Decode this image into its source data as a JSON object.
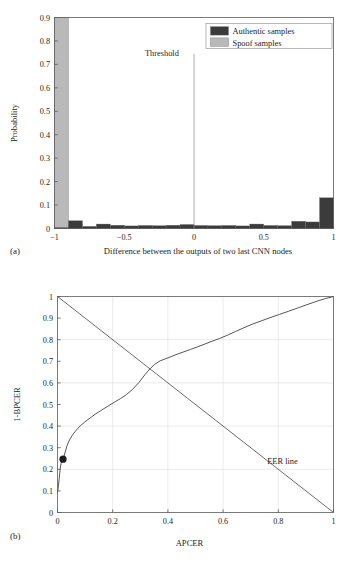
{
  "figure": {
    "background": "#ffffff",
    "panels": [
      {
        "label": "(a)"
      },
      {
        "label": "(b)"
      }
    ]
  },
  "colors": {
    "authentic": "#3b3b3b",
    "spoof": "#b9b9b9",
    "axis": "#5a5a5a",
    "grid": "#e2e2e2",
    "curve": "#565656",
    "eer": "#4f4f4f",
    "marker": "#1c1c1c",
    "legend_border": "#9a9a9a"
  },
  "chart_data": [
    {
      "type": "bar",
      "panel": "(a)",
      "title": "",
      "xlabel": "Difference between the outputs of two last CNN nodes",
      "ylabel": "Probability",
      "xlim": [
        -1,
        1
      ],
      "ylim": [
        0,
        0.9
      ],
      "xticks": [
        -1,
        -0.5,
        0,
        0.5,
        1
      ],
      "xtick_labels": [
        "−1",
        "−0.5",
        "0",
        "0.5",
        "1"
      ],
      "yticks": [
        0,
        0.1,
        0.2,
        0.3,
        0.4,
        0.5,
        0.6,
        0.7,
        0.8,
        0.9
      ],
      "ytick_labels": [
        "0",
        "0.1",
        "0.2",
        "0.3",
        "0.4",
        "0.5",
        "0.6",
        "0.7",
        "0.8",
        "0.9"
      ],
      "grid": false,
      "legend_position": "top-right",
      "bin_edges": [
        -1.0,
        -0.9,
        -0.8,
        -0.7,
        -0.6,
        -0.5,
        -0.4,
        -0.3,
        -0.2,
        -0.1,
        0.0,
        0.1,
        0.2,
        0.3,
        0.4,
        0.5,
        0.6,
        0.7,
        0.8,
        0.9,
        1.0
      ],
      "series": [
        {
          "name": "Spoof samples",
          "color": "#b9b9b9",
          "values": [
            0.9,
            0.018,
            0.006,
            0.004,
            0.004,
            0.004,
            0.003,
            0.003,
            0.003,
            0.003,
            0.003,
            0.002,
            0.002,
            0.002,
            0.002,
            0.002,
            0.002,
            0.002,
            0.002,
            0.002
          ]
        },
        {
          "name": "Authentic samples",
          "color": "#3b3b3b",
          "values": [
            0.004,
            0.033,
            0.009,
            0.019,
            0.014,
            0.011,
            0.013,
            0.012,
            0.014,
            0.017,
            0.013,
            0.012,
            0.013,
            0.011,
            0.019,
            0.013,
            0.012,
            0.031,
            0.028,
            0.131
          ]
        }
      ],
      "annotations": [
        {
          "text": "Threshold",
          "x": -0.23,
          "y": 0.735,
          "line_x": 0.0,
          "line_y_top": 0.745,
          "line_y_bottom": 0.0
        }
      ]
    },
    {
      "type": "line",
      "panel": "(b)",
      "title": "",
      "xlabel": "APCER",
      "ylabel": "1-BPCER",
      "xlim": [
        0,
        1
      ],
      "ylim": [
        0,
        1
      ],
      "xticks": [
        0,
        0.2,
        0.4,
        0.6,
        0.8,
        1
      ],
      "xtick_labels": [
        "0",
        "0.2",
        "0.4",
        "0.6",
        "0.8",
        "1"
      ],
      "yticks": [
        0,
        0.1,
        0.2,
        0.3,
        0.4,
        0.5,
        0.6,
        0.7,
        0.8,
        0.9,
        1
      ],
      "ytick_labels": [
        "0",
        "0.1",
        "0.2",
        "0.3",
        "0.4",
        "0.5",
        "0.6",
        "0.7",
        "0.8",
        "0.9",
        "1"
      ],
      "grid": true,
      "legend_position": "none",
      "series": [
        {
          "name": "ROC curve",
          "color": "#565656",
          "x": [
            0.0,
            0.002,
            0.004,
            0.006,
            0.008,
            0.01,
            0.013,
            0.016,
            0.02,
            0.024,
            0.029,
            0.034,
            0.04,
            0.047,
            0.055,
            0.064,
            0.074,
            0.085,
            0.097,
            0.11,
            0.124,
            0.139,
            0.155,
            0.172,
            0.19,
            0.209,
            0.229,
            0.25,
            0.272,
            0.295,
            0.318,
            0.335,
            0.352,
            0.372,
            0.392,
            0.412,
            0.434,
            0.458,
            0.482,
            0.508,
            0.534,
            0.56,
            0.588,
            0.616,
            0.645,
            0.675,
            0.706,
            0.738,
            0.77,
            0.804,
            0.838,
            0.873,
            0.908,
            0.944,
            0.972,
            1.0
          ],
          "y": [
            0.09,
            0.11,
            0.132,
            0.156,
            0.18,
            0.205,
            0.228,
            0.238,
            0.247,
            0.262,
            0.285,
            0.307,
            0.327,
            0.344,
            0.36,
            0.375,
            0.39,
            0.404,
            0.417,
            0.43,
            0.443,
            0.457,
            0.47,
            0.484,
            0.498,
            0.513,
            0.528,
            0.546,
            0.57,
            0.602,
            0.64,
            0.665,
            0.686,
            0.702,
            0.712,
            0.722,
            0.733,
            0.744,
            0.755,
            0.767,
            0.78,
            0.793,
            0.806,
            0.821,
            0.838,
            0.855,
            0.872,
            0.887,
            0.902,
            0.917,
            0.932,
            0.948,
            0.964,
            0.98,
            0.991,
            1.0
          ]
        },
        {
          "name": "EER line",
          "color": "#4f4f4f",
          "x": [
            0,
            1
          ],
          "y": [
            1,
            0
          ]
        }
      ],
      "markers": [
        {
          "name": "operating-point",
          "x": 0.02,
          "y": 0.247,
          "color": "#1c1c1c",
          "radius": 3.6
        }
      ],
      "annotations": [
        {
          "text": "EER line",
          "x": 0.76,
          "y": 0.225
        }
      ]
    }
  ]
}
